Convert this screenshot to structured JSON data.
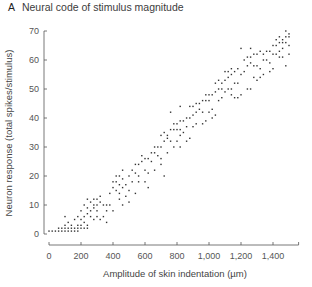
{
  "title": {
    "panel": "A",
    "text": "Neural code of stimulus magnitude"
  },
  "chart_data": {
    "type": "scatter",
    "title": "Neural code of stimulus magnitude",
    "xlabel": "Amplitude of skin indentation (µm)",
    "ylabel": "Neuron response (total spikes/stimulus)",
    "xlim": [
      0,
      1560
    ],
    "ylim": [
      0,
      70
    ],
    "xticks": [
      0,
      200,
      400,
      600,
      800,
      1000,
      1200,
      1400
    ],
    "xtick_labels": [
      "0",
      "200",
      "400",
      "600",
      "800",
      "1,000",
      "1,200",
      "1,400"
    ],
    "yticks": [
      0,
      10,
      20,
      30,
      40,
      50,
      60,
      70
    ],
    "ytick_labels": [
      "0",
      "10",
      "20",
      "30",
      "40",
      "50",
      "60",
      "70"
    ],
    "grid": false,
    "legend": null,
    "marker_color": "#333333",
    "points": [
      [
        0,
        1
      ],
      [
        20,
        1
      ],
      [
        40,
        1
      ],
      [
        60,
        1
      ],
      [
        80,
        1
      ],
      [
        100,
        1
      ],
      [
        120,
        1
      ],
      [
        140,
        1
      ],
      [
        160,
        1
      ],
      [
        180,
        1
      ],
      [
        60,
        2
      ],
      [
        80,
        2
      ],
      [
        100,
        2
      ],
      [
        120,
        2
      ],
      [
        140,
        2
      ],
      [
        160,
        2
      ],
      [
        180,
        2
      ],
      [
        200,
        2
      ],
      [
        220,
        2
      ],
      [
        240,
        2
      ],
      [
        100,
        3
      ],
      [
        140,
        3
      ],
      [
        180,
        3
      ],
      [
        200,
        3
      ],
      [
        220,
        4
      ],
      [
        120,
        4
      ],
      [
        160,
        5
      ],
      [
        100,
        6
      ],
      [
        200,
        5
      ],
      [
        240,
        3
      ],
      [
        180,
        6
      ],
      [
        220,
        6
      ],
      [
        240,
        7
      ],
      [
        260,
        6
      ],
      [
        280,
        5
      ],
      [
        200,
        8
      ],
      [
        240,
        9
      ],
      [
        260,
        8
      ],
      [
        280,
        9
      ],
      [
        300,
        8
      ],
      [
        220,
        10
      ],
      [
        260,
        11
      ],
      [
        280,
        10
      ],
      [
        300,
        10
      ],
      [
        320,
        11
      ],
      [
        340,
        10
      ],
      [
        360,
        10
      ],
      [
        280,
        12
      ],
      [
        300,
        12
      ],
      [
        240,
        12
      ],
      [
        320,
        13
      ],
      [
        360,
        8
      ],
      [
        380,
        10
      ],
      [
        400,
        8
      ],
      [
        380,
        14
      ],
      [
        400,
        16
      ],
      [
        420,
        15
      ],
      [
        440,
        14
      ],
      [
        400,
        18
      ],
      [
        420,
        18
      ],
      [
        440,
        17
      ],
      [
        460,
        19
      ],
      [
        420,
        20
      ],
      [
        440,
        20
      ],
      [
        460,
        16
      ],
      [
        480,
        13
      ],
      [
        500,
        15
      ],
      [
        480,
        17
      ],
      [
        460,
        22
      ],
      [
        500,
        20
      ],
      [
        520,
        18
      ],
      [
        520,
        22
      ],
      [
        540,
        21
      ],
      [
        560,
        20
      ],
      [
        540,
        24
      ],
      [
        560,
        24
      ],
      [
        580,
        25
      ],
      [
        600,
        26
      ],
      [
        580,
        27
      ],
      [
        600,
        22
      ],
      [
        620,
        21
      ],
      [
        620,
        26
      ],
      [
        640,
        25
      ],
      [
        560,
        18
      ],
      [
        600,
        18
      ],
      [
        640,
        28
      ],
      [
        660,
        28
      ],
      [
        680,
        27
      ],
      [
        700,
        26
      ],
      [
        660,
        30
      ],
      [
        680,
        30
      ],
      [
        700,
        30
      ],
      [
        720,
        32
      ],
      [
        740,
        33
      ],
      [
        700,
        34
      ],
      [
        720,
        35
      ],
      [
        740,
        34
      ],
      [
        760,
        36
      ],
      [
        780,
        36
      ],
      [
        800,
        36
      ],
      [
        820,
        36
      ],
      [
        740,
        28
      ],
      [
        760,
        32
      ],
      [
        780,
        30
      ],
      [
        800,
        32
      ],
      [
        820,
        34
      ],
      [
        840,
        35
      ],
      [
        860,
        37
      ],
      [
        780,
        38
      ],
      [
        800,
        38
      ],
      [
        820,
        39
      ],
      [
        840,
        39
      ],
      [
        860,
        40
      ],
      [
        880,
        40
      ],
      [
        900,
        41
      ],
      [
        900,
        37
      ],
      [
        920,
        38
      ],
      [
        920,
        42
      ],
      [
        940,
        43
      ],
      [
        960,
        42
      ],
      [
        880,
        44
      ],
      [
        900,
        44
      ],
      [
        920,
        45
      ],
      [
        940,
        45
      ],
      [
        960,
        46
      ],
      [
        980,
        46
      ],
      [
        1000,
        46
      ],
      [
        1000,
        42
      ],
      [
        1020,
        43
      ],
      [
        980,
        48
      ],
      [
        1000,
        48
      ],
      [
        1020,
        48
      ],
      [
        1040,
        49
      ],
      [
        1060,
        50
      ],
      [
        1080,
        50
      ],
      [
        1080,
        47
      ],
      [
        1100,
        49
      ],
      [
        1040,
        52
      ],
      [
        1060,
        53
      ],
      [
        1080,
        52
      ],
      [
        1100,
        53
      ],
      [
        1120,
        54
      ],
      [
        1140,
        55
      ],
      [
        1100,
        56
      ],
      [
        1120,
        56
      ],
      [
        1140,
        57
      ],
      [
        1160,
        56
      ],
      [
        1180,
        57
      ],
      [
        1120,
        50
      ],
      [
        1140,
        50
      ],
      [
        1160,
        52
      ],
      [
        1180,
        52
      ],
      [
        1200,
        55
      ],
      [
        1220,
        56
      ],
      [
        1220,
        60
      ],
      [
        1240,
        58
      ],
      [
        1260,
        59
      ],
      [
        1280,
        58
      ],
      [
        1300,
        58
      ],
      [
        1320,
        57
      ],
      [
        1240,
        61
      ],
      [
        1260,
        61
      ],
      [
        1280,
        62
      ],
      [
        1300,
        62
      ],
      [
        1320,
        63
      ],
      [
        1200,
        64
      ],
      [
        1260,
        64
      ],
      [
        1340,
        60
      ],
      [
        1360,
        60
      ],
      [
        1380,
        59
      ],
      [
        1340,
        62
      ],
      [
        1360,
        63
      ],
      [
        1380,
        63
      ],
      [
        1400,
        62
      ],
      [
        1420,
        62
      ],
      [
        1440,
        61
      ],
      [
        1460,
        61
      ],
      [
        1480,
        58
      ],
      [
        1400,
        65
      ],
      [
        1420,
        65
      ],
      [
        1440,
        66
      ],
      [
        1460,
        66
      ],
      [
        1480,
        66
      ],
      [
        1420,
        67
      ],
      [
        1440,
        68
      ],
      [
        1460,
        67
      ],
      [
        1480,
        68
      ],
      [
        1500,
        68
      ],
      [
        1480,
        70
      ],
      [
        1500,
        69
      ],
      [
        1500,
        62
      ],
      [
        1460,
        64
      ],
      [
        1440,
        63
      ],
      [
        1500,
        65
      ],
      [
        1380,
        56
      ],
      [
        1400,
        57
      ],
      [
        1320,
        54
      ],
      [
        1340,
        55
      ],
      [
        1280,
        54
      ],
      [
        1300,
        53
      ],
      [
        1240,
        50
      ],
      [
        1260,
        50
      ],
      [
        1160,
        47
      ],
      [
        1180,
        47
      ],
      [
        1200,
        48
      ],
      [
        1020,
        40
      ],
      [
        1040,
        41
      ],
      [
        960,
        38
      ],
      [
        980,
        39
      ],
      [
        860,
        32
      ],
      [
        880,
        33
      ],
      [
        820,
        30
      ],
      [
        660,
        22
      ],
      [
        700,
        24
      ],
      [
        720,
        20
      ],
      [
        620,
        16
      ],
      [
        540,
        14
      ],
      [
        500,
        11
      ],
      [
        460,
        10
      ],
      [
        340,
        6
      ],
      [
        320,
        5
      ],
      [
        360,
        4
      ],
      [
        300,
        6
      ],
      [
        440,
        12
      ],
      [
        760,
        42
      ],
      [
        820,
        44
      ],
      [
        1060,
        46
      ],
      [
        1140,
        48
      ]
    ]
  }
}
